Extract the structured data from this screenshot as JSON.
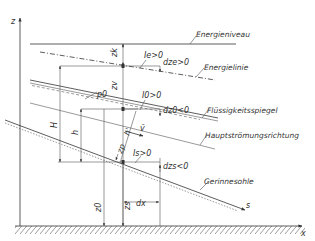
{
  "diagram": {
    "title": "",
    "axes": {
      "z_label": "z",
      "x_label": "x",
      "s_label": "s"
    },
    "lines": {
      "energy_level": "Energieniveau",
      "energy_line": "Energielinie",
      "water_surface": "Flüssigkeitsspiegel",
      "main_flow": "Hauptströmungsrichtung",
      "channel_bed": "Gerinnesohle"
    },
    "symbols": {
      "zk": "zk",
      "zv": "zv",
      "p0": "p0",
      "H": "H",
      "h": "h",
      "h_prime": "h'",
      "v_bar": "v̄",
      "zp": "zp",
      "z0": "z0",
      "zs": "zs",
      "dx": "dx"
    },
    "slopes": {
      "Ie": "Ie>0",
      "dze": "dze>0",
      "I0": "I0>0",
      "dz0": "dz0<0",
      "Is": "Is>0",
      "dzs": "dzs<0"
    },
    "colors": {
      "line": "#333333",
      "background": "#ffffff"
    }
  }
}
